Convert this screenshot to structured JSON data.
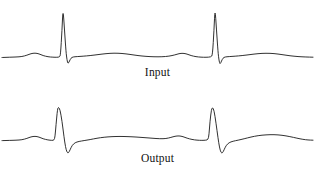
{
  "figure": {
    "background_color": "#ffffff",
    "line_color": "#1a1a1a",
    "width": 315,
    "height": 170
  },
  "panels": [
    {
      "id": "input",
      "label": "Input",
      "description": "ECG waveform, two heartbeats, tall narrow R peaks"
    },
    {
      "id": "output",
      "label": "Output",
      "description": "ECG waveform, two heartbeats, reduced amplitude R peaks"
    }
  ],
  "chart_data": {
    "type": "line",
    "title": "",
    "xlabel": "",
    "ylabel": "",
    "grid": false,
    "legend": "none",
    "x_range": [
      0,
      315
    ],
    "y_range": [
      0,
      85
    ],
    "note": "Two stacked ECG strip traces. y values are in pixel space of each 315x85 panel, smaller y = higher amplitude. Baseline of input trace y=57, baseline of output trace y=55 (panel-local).",
    "series": [
      {
        "name": "Input",
        "baseline_y": 57,
        "r_peak_x": [
          63,
          215
        ],
        "r_peak_y": 8,
        "s_trough_y": 64,
        "points": [
          [
            2,
            57.5
          ],
          [
            10,
            57.2
          ],
          [
            16,
            57.0
          ],
          [
            22,
            56.6
          ],
          [
            27,
            55.2
          ],
          [
            31,
            53.6
          ],
          [
            35,
            53.0
          ],
          [
            39,
            53.8
          ],
          [
            43,
            55.6
          ],
          [
            48,
            56.8
          ],
          [
            53,
            57.2
          ],
          [
            57,
            57.3
          ],
          [
            59.5,
            57.0
          ],
          [
            60.5,
            55.0
          ],
          [
            62,
            30.0
          ],
          [
            63,
            8.0
          ],
          [
            64.5,
            30.0
          ],
          [
            66,
            52.0
          ],
          [
            67,
            60.0
          ],
          [
            68,
            64.0
          ],
          [
            69.5,
            61.0
          ],
          [
            71,
            58.0
          ],
          [
            73,
            56.9
          ],
          [
            77,
            56.6
          ],
          [
            83,
            56.2
          ],
          [
            90,
            55.6
          ],
          [
            98,
            54.6
          ],
          [
            106,
            53.6
          ],
          [
            114,
            53.1
          ],
          [
            122,
            53.4
          ],
          [
            130,
            54.4
          ],
          [
            138,
            55.6
          ],
          [
            146,
            56.4
          ],
          [
            154,
            56.8
          ],
          [
            162,
            56.8
          ],
          [
            169,
            56.2
          ],
          [
            175,
            54.9
          ],
          [
            179,
            53.6
          ],
          [
            183,
            53.2
          ],
          [
            187,
            54.0
          ],
          [
            191,
            55.6
          ],
          [
            196,
            56.7
          ],
          [
            201,
            57.2
          ],
          [
            206,
            57.3
          ],
          [
            211,
            57.0
          ],
          [
            212.5,
            55.0
          ],
          [
            214,
            30.0
          ],
          [
            215,
            7.5
          ],
          [
            216.5,
            30.0
          ],
          [
            218,
            52.0
          ],
          [
            219,
            60.5
          ],
          [
            220,
            64.5
          ],
          [
            221.5,
            61.0
          ],
          [
            223,
            58.0
          ],
          [
            225,
            56.9
          ],
          [
            229,
            56.6
          ],
          [
            235,
            56.2
          ],
          [
            242,
            55.6
          ],
          [
            250,
            54.6
          ],
          [
            258,
            53.6
          ],
          [
            266,
            53.2
          ],
          [
            274,
            53.5
          ],
          [
            282,
            54.6
          ],
          [
            290,
            55.8
          ],
          [
            298,
            56.6
          ],
          [
            306,
            57.0
          ],
          [
            313,
            57.2
          ]
        ]
      },
      {
        "name": "Output",
        "baseline_y": 55,
        "r_peak_x": [
          58,
          212
        ],
        "r_peak_y": 22,
        "s_trough_y": 68,
        "points": [
          [
            2,
            55.6
          ],
          [
            10,
            55.4
          ],
          [
            16,
            55.2
          ],
          [
            22,
            54.8
          ],
          [
            27,
            53.4
          ],
          [
            31,
            51.8
          ],
          [
            35,
            51.2
          ],
          [
            39,
            52.0
          ],
          [
            43,
            53.8
          ],
          [
            48,
            55.0
          ],
          [
            52,
            55.4
          ],
          [
            54,
            55.2
          ],
          [
            55,
            52.0
          ],
          [
            56,
            40.0
          ],
          [
            57.5,
            24.0
          ],
          [
            58.5,
            22.0
          ],
          [
            60,
            24.5
          ],
          [
            62,
            36.0
          ],
          [
            64,
            52.0
          ],
          [
            65.5,
            62.0
          ],
          [
            67,
            67.5
          ],
          [
            68.5,
            68.0
          ],
          [
            70,
            65.0
          ],
          [
            72,
            60.5
          ],
          [
            75,
            57.6
          ],
          [
            79,
            56.4
          ],
          [
            84,
            55.6
          ],
          [
            90,
            54.6
          ],
          [
            97,
            53.2
          ],
          [
            104,
            52.2
          ],
          [
            112,
            51.6
          ],
          [
            120,
            51.4
          ],
          [
            128,
            51.6
          ],
          [
            136,
            52.0
          ],
          [
            144,
            52.6
          ],
          [
            152,
            53.2
          ],
          [
            160,
            53.8
          ],
          [
            166,
            53.6
          ],
          [
            171,
            52.4
          ],
          [
            175,
            51.2
          ],
          [
            179,
            50.8
          ],
          [
            183,
            51.6
          ],
          [
            187,
            53.2
          ],
          [
            192,
            54.5
          ],
          [
            197,
            55.2
          ],
          [
            202,
            55.4
          ],
          [
            206,
            55.2
          ],
          [
            208,
            54.6
          ],
          [
            209,
            50.0
          ],
          [
            210,
            36.0
          ],
          [
            211.5,
            24.0
          ],
          [
            212.5,
            22.5
          ],
          [
            214,
            25.0
          ],
          [
            216,
            38.0
          ],
          [
            218,
            53.0
          ],
          [
            219.5,
            62.5
          ],
          [
            221,
            67.8
          ],
          [
            222.5,
            68.0
          ],
          [
            224,
            65.0
          ],
          [
            226,
            60.6
          ],
          [
            229,
            57.6
          ],
          [
            233,
            56.2
          ],
          [
            238,
            55.2
          ],
          [
            244,
            53.8
          ],
          [
            251,
            52.0
          ],
          [
            258,
            50.6
          ],
          [
            266,
            49.8
          ],
          [
            274,
            49.6
          ],
          [
            282,
            50.2
          ],
          [
            290,
            51.6
          ],
          [
            297,
            53.2
          ],
          [
            303,
            54.4
          ],
          [
            308,
            55.0
          ],
          [
            313,
            55.2
          ]
        ]
      }
    ]
  }
}
